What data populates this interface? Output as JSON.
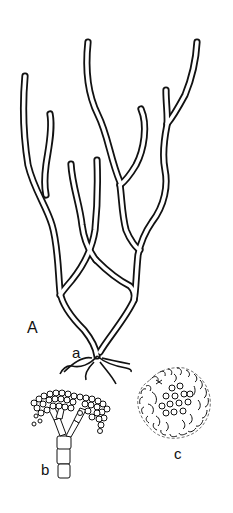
{
  "figure": {
    "labels": {
      "panel": "A",
      "holdfast": "a",
      "branch_tip_detail": "b",
      "cluster_detail": "c"
    },
    "colors": {
      "line": "#111111",
      "background": "#ffffff"
    }
  }
}
